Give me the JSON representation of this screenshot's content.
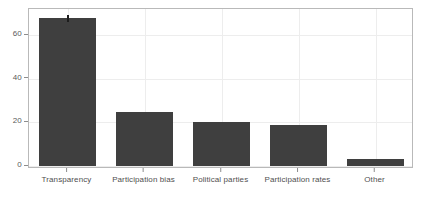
{
  "chart_data": {
    "type": "bar",
    "title": "",
    "subtitle": "",
    "xlabel": "",
    "ylabel": "",
    "categories": [
      "Transparency",
      "Participation bias",
      "Political parties",
      "Participation rates",
      "Other"
    ],
    "values": [
      68,
      25,
      20,
      19,
      3
    ],
    "ylim": [
      0,
      72
    ],
    "yticks": [
      0,
      20,
      40,
      60
    ],
    "ytick_labels": [
      "0",
      "20",
      "40",
      "60"
    ],
    "grid": true,
    "legend": null,
    "bar_color": "#3f3f3f",
    "frame_color": "#b9b9b9",
    "gridline_color": "#ededed",
    "background_color": "#ffffff",
    "tick_label_color": "#5a5a5a",
    "annotations": [
      {
        "type": "marker",
        "category": "Transparency",
        "description": "small dark vertical tick at top of first bar"
      }
    ]
  }
}
